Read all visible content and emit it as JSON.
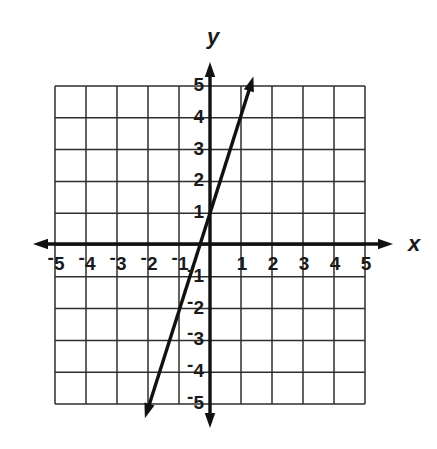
{
  "figure": {
    "background": "#ffffff"
  },
  "chart_data": {
    "type": "line",
    "title": "",
    "xlabel": "x",
    "ylabel": "y",
    "xlim": [
      -5,
      5
    ],
    "ylim": [
      -5,
      5
    ],
    "grid": true,
    "grid_step": 1,
    "legend": "none",
    "negative_sign_style": "raised",
    "x_ticks": {
      "values": [
        -5,
        -4,
        -3,
        -2,
        -1,
        1,
        2,
        3,
        4,
        5
      ],
      "labels": [
        "-5",
        "-4",
        "-3",
        "-2",
        "-1",
        "1",
        "2",
        "3",
        "4",
        "5"
      ]
    },
    "y_ticks": {
      "values": [
        5,
        4,
        3,
        2,
        1,
        -1,
        -2,
        -3,
        -4,
        -5
      ],
      "labels": [
        "5",
        "4",
        "3",
        "2",
        "1",
        "-1",
        "-2",
        "-3",
        "-4",
        "-5"
      ]
    },
    "series": [
      {
        "name": "plotted-line",
        "equation": "y = 3x + 1",
        "slope": 3,
        "y_intercept": 1,
        "x_intercept": -0.333,
        "points_on_line": [
          [
            -2,
            -5
          ],
          [
            -1,
            -2
          ],
          [
            0,
            1
          ],
          [
            1,
            4
          ]
        ],
        "segment": {
          "from": [
            -2.1,
            -5.45
          ],
          "to": [
            1.4,
            5.3
          ]
        },
        "arrows": "both"
      }
    ],
    "style": {
      "background": "#ffffff",
      "grid_color": "#2e2e2e",
      "axis_color": "#111111",
      "line_color": "#111111",
      "label_color": "#1a1a1a"
    }
  }
}
